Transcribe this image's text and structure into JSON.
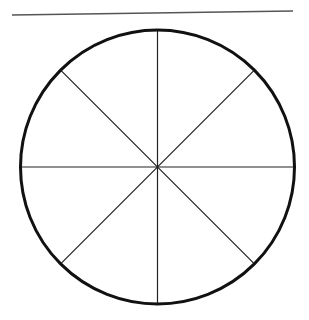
{
  "diagram": {
    "type": "circle divided into 8 equal sectors",
    "top_line": {
      "x1": 12,
      "y1": 15,
      "x2": 293,
      "y2": 11,
      "color": "#555555"
    },
    "circle": {
      "cx": 157.5,
      "cy": 167,
      "r": 137,
      "stroke": "#111111",
      "stroke_width": 3
    },
    "sector_count": 8,
    "divider_color": "#222222"
  }
}
